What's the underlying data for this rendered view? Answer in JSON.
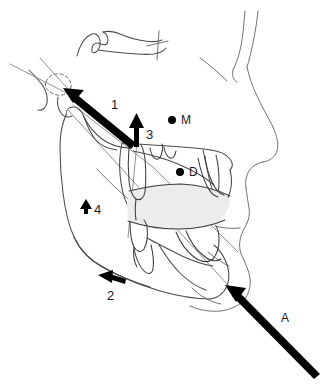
{
  "figure": {
    "type": "cephalometric-tracing",
    "background_color": "#ffffff",
    "trace_color": "#4a4a4a",
    "arrow_color": "#000000",
    "occlusal_fill_color": "#ececec",
    "width": 329,
    "height": 387
  },
  "labels": {
    "arrow1": "1",
    "arrow2": "2",
    "arrow3": "3",
    "arrow4": "4",
    "arrowA": "A",
    "pointM": "M",
    "pointD": "D"
  },
  "annotations": [
    {
      "id": "arrow-1",
      "label": "1",
      "kind": "force-arrow-large",
      "direction": "up-left",
      "label_x": 111,
      "label_y": 98
    },
    {
      "id": "arrow-2",
      "label": "2",
      "kind": "force-arrow-small",
      "direction": "left",
      "label_x": 107,
      "label_y": 289
    },
    {
      "id": "arrow-3",
      "label": "3",
      "kind": "force-arrow-small",
      "direction": "up",
      "label_x": 146,
      "label_y": 128
    },
    {
      "id": "arrow-4",
      "label": "4",
      "kind": "force-arrow-tiny",
      "direction": "up",
      "label_x": 94,
      "label_y": 208
    },
    {
      "id": "arrow-A",
      "label": "A",
      "kind": "force-arrow-large",
      "direction": "up-left",
      "label_x": 281,
      "label_y": 315
    },
    {
      "id": "point-M",
      "label": "M",
      "kind": "landmark-dot",
      "dot_x": 172,
      "dot_y": 120,
      "label_x": 180,
      "label_y": 115
    },
    {
      "id": "point-D",
      "label": "D",
      "kind": "landmark-dot",
      "dot_x": 180,
      "dot_y": 172,
      "label_x": 188,
      "label_y": 167
    }
  ]
}
